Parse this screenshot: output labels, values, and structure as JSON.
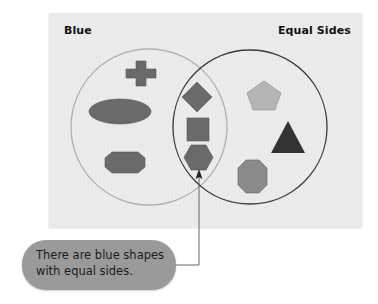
{
  "diagram": {
    "type": "venn",
    "sets": [
      {
        "label": "Blue",
        "circle_stroke": "#b0b0b0"
      },
      {
        "label": "Equal Sides",
        "circle_stroke": "#3a3a3a"
      }
    ],
    "regions": {
      "blue_only": [
        "cross",
        "ellipse",
        "irregular-octagon"
      ],
      "intersection": [
        "diamond",
        "square",
        "hexagon"
      ],
      "equal_sides_only": [
        "pentagon",
        "triangle",
        "octagon"
      ]
    },
    "colors": {
      "panel_background": "#ececec",
      "blue_shapes": "#6a6a6a",
      "pentagon": "#b5b5b5",
      "triangle": "#333333",
      "octagon": "#8a8a8a",
      "callout_background": "#9a9a9a"
    }
  },
  "labels": {
    "left_set": "Blue",
    "right_set": "Equal Sides"
  },
  "callout": {
    "text_line1": "There are blue shapes",
    "text_line2": "with equal sides."
  }
}
